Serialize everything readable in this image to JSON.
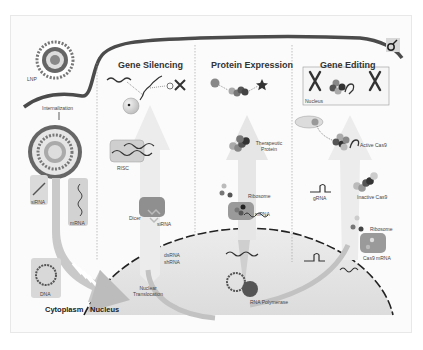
{
  "diagram": {
    "type": "biological-mechanism-illustration",
    "columns": [
      {
        "title": "Gene Silencing"
      },
      {
        "title": "Protein Expression"
      },
      {
        "title": "Gene Editing"
      }
    ],
    "left_panel": {
      "lnp": "LNP",
      "internalization": "Internalization",
      "cargo": [
        "siRNA",
        "mRNA",
        "DNA"
      ]
    },
    "regions": {
      "cytoplasm": "Cytoplasm",
      "nucleus": "Nucleus"
    },
    "gene_silencing": {
      "risc": "RISC",
      "dicer": "Dicer",
      "sirna": "siRNA",
      "dsrna": "dsRNA",
      "shrna": "shRNA",
      "nuclear_translocation_1": "Nuclear",
      "nuclear_translocation_2": "Translocation"
    },
    "protein_expression": {
      "therapeutic_1": "Therapeutic",
      "therapeutic_2": "Protein",
      "ribosome": "Ribosome",
      "mrna": "mRNA",
      "rna_polymerase": "RNA Polymerase"
    },
    "gene_editing": {
      "nucleus_inset": "Nucleus",
      "active_cas9": "Active Cas9",
      "grna": "gRNA",
      "inactive_cas9": "Inactive Cas9",
      "ribosome": "Ribosome",
      "cas9_mrna": "Cas9 mRNA"
    },
    "icons": [
      "lnp-particle-icon",
      "endosome-icon",
      "female-symbol-icon",
      "chromosome-icon",
      "ribosome-icon",
      "dna-plasmid-icon",
      "star-protein-icon"
    ],
    "colors": {
      "membrane": "#4a4a4a",
      "arrow": "#e4e4e4",
      "nucleus_fill": "#e9e9e9",
      "box_fill": "#dcdcdc",
      "cargo_box": "#c8c8c8",
      "dark_ball": "#555555"
    }
  }
}
